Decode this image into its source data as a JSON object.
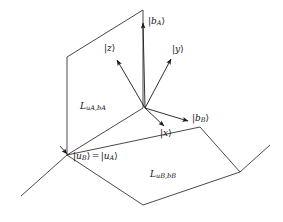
{
  "figure": {
    "name": "two-basis-quantum-state-axes-diagram",
    "background_color": "#ffffff",
    "line_color": "#1a1a1a",
    "width": 283,
    "height": 222
  },
  "labels": {
    "b_A": {
      "bar": "|",
      "var": "b",
      "sub": "A",
      "close": "⟩"
    },
    "b_B": {
      "bar": "|",
      "var": "b",
      "sub": "B",
      "close": "⟩"
    },
    "z": {
      "bar": "|",
      "var": "z",
      "close": "⟩"
    },
    "y": {
      "bar": "|",
      "var": "y",
      "close": "⟩"
    },
    "x": {
      "bar": "|",
      "var": "x",
      "close": "⟩"
    },
    "u_equality": {
      "left_bar": "|",
      "left_var": "u",
      "left_sub": "B",
      "left_close": "⟩",
      "equals": "=",
      "right_bar": "|",
      "right_var": "u",
      "right_sub": "A",
      "right_close": "⟩"
    },
    "plane_A": {
      "big": "L",
      "sub": "uₐ,bₐ"
    },
    "plane_B": {
      "big": "L",
      "sub": "uᴮ,bᴮ"
    }
  },
  "plane_A_subscript_parts": {
    "u": "u",
    "a1": "A",
    "comma": ",",
    "b": "b",
    "a2": "A"
  },
  "plane_B_subscript_parts": {
    "u": "u",
    "b1": "B",
    "comma": ",",
    "b": "b",
    "b2": "B"
  },
  "geometry": {
    "origin": [
      145,
      108
    ],
    "vertical_plane_corners": [
      [
        67,
        57
      ],
      [
        143,
        10
      ],
      [
        143,
        108
      ],
      [
        67,
        155
      ]
    ],
    "horizontal_plane_corners": [
      [
        67,
        155
      ],
      [
        200,
        127
      ],
      [
        240,
        172
      ],
      [
        143,
        205
      ]
    ],
    "axes": [
      {
        "name": "b_A",
        "from": [
          145,
          108
        ],
        "to": [
          143,
          22
        ]
      },
      {
        "name": "z",
        "from": [
          145,
          108
        ],
        "to": [
          116,
          58
        ]
      },
      {
        "name": "y",
        "from": [
          145,
          108
        ],
        "to": [
          172,
          57
        ]
      },
      {
        "name": "x",
        "from": [
          145,
          108
        ],
        "to": [
          166,
          128
        ]
      },
      {
        "name": "b_B",
        "from": [
          145,
          108
        ],
        "to": [
          190,
          122
        ]
      }
    ],
    "extension_lines": [
      {
        "name": "left-floor-extension",
        "from": [
          67,
          155
        ],
        "to": [
          21,
          196
        ]
      },
      {
        "name": "right-floor-extension",
        "from": [
          240,
          172
        ],
        "to": [
          270,
          145
        ]
      }
    ]
  }
}
